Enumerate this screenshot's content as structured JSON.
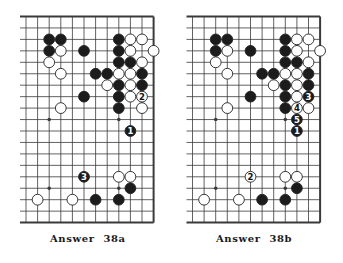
{
  "colors": {
    "background": "#ffffff",
    "line": "#3a3a3a",
    "black_stone": "#1c1c1c",
    "white_stone": "#ffffff",
    "stone_outline": "#222222"
  },
  "grid": {
    "cols": 12,
    "rows": 19,
    "open_left_edge": true,
    "spacing_x": 11.6,
    "spacing_y": 11.45
  },
  "diagrams": [
    {
      "id": "38a",
      "caption_word": "Answer",
      "caption_number": "38a",
      "origin": [
        26,
        16.5
      ],
      "star_points": [
        [
          2,
          9
        ],
        [
          8,
          9
        ],
        [
          2,
          15
        ],
        [
          8,
          15
        ]
      ],
      "stones": [
        {
          "c": 2,
          "r": 2,
          "color": "black"
        },
        {
          "c": 3,
          "r": 2,
          "color": "black"
        },
        {
          "c": 8,
          "r": 2,
          "color": "black"
        },
        {
          "c": 9,
          "r": 2,
          "color": "white"
        },
        {
          "c": 10,
          "r": 2,
          "color": "white"
        },
        {
          "c": 2,
          "r": 3,
          "color": "black"
        },
        {
          "c": 3,
          "r": 3,
          "color": "white"
        },
        {
          "c": 5,
          "r": 3,
          "color": "black"
        },
        {
          "c": 8,
          "r": 3,
          "color": "black"
        },
        {
          "c": 9,
          "r": 3,
          "color": "white"
        },
        {
          "c": 11,
          "r": 3,
          "color": "white"
        },
        {
          "c": 2,
          "r": 4,
          "color": "white"
        },
        {
          "c": 8,
          "r": 4,
          "color": "black"
        },
        {
          "c": 9,
          "r": 4,
          "color": "black"
        },
        {
          "c": 10,
          "r": 4,
          "color": "white"
        },
        {
          "c": 3,
          "r": 5,
          "color": "white"
        },
        {
          "c": 6,
          "r": 5,
          "color": "black"
        },
        {
          "c": 7,
          "r": 5,
          "color": "black"
        },
        {
          "c": 8,
          "r": 5,
          "color": "white"
        },
        {
          "c": 9,
          "r": 5,
          "color": "white"
        },
        {
          "c": 10,
          "r": 5,
          "color": "black"
        },
        {
          "c": 7,
          "r": 6,
          "color": "white"
        },
        {
          "c": 8,
          "r": 6,
          "color": "black"
        },
        {
          "c": 9,
          "r": 6,
          "color": "white"
        },
        {
          "c": 10,
          "r": 6,
          "color": "black"
        },
        {
          "c": 5,
          "r": 7,
          "color": "black"
        },
        {
          "c": 8,
          "r": 7,
          "color": "black"
        },
        {
          "c": 9,
          "r": 7,
          "color": "white"
        },
        {
          "c": 10,
          "r": 7,
          "color": "white",
          "label": "2"
        },
        {
          "c": 3,
          "r": 8,
          "color": "white"
        },
        {
          "c": 8,
          "r": 8,
          "color": "black"
        },
        {
          "c": 10,
          "r": 8,
          "color": "white"
        },
        {
          "c": 9,
          "r": 10,
          "color": "black",
          "label": "1"
        },
        {
          "c": 5,
          "r": 14,
          "color": "black",
          "label": "3"
        },
        {
          "c": 8,
          "r": 14,
          "color": "white"
        },
        {
          "c": 9,
          "r": 14,
          "color": "white"
        },
        {
          "c": 9,
          "r": 15,
          "color": "black"
        },
        {
          "c": 1,
          "r": 16,
          "color": "white"
        },
        {
          "c": 4,
          "r": 16,
          "color": "white"
        },
        {
          "c": 6,
          "r": 16,
          "color": "black"
        },
        {
          "c": 8,
          "r": 16,
          "color": "black"
        }
      ]
    },
    {
      "id": "38b",
      "caption_word": "Answer",
      "caption_number": "38b",
      "origin": [
        192.5,
        16.5
      ],
      "star_points": [
        [
          2,
          9
        ],
        [
          8,
          9
        ],
        [
          2,
          15
        ],
        [
          8,
          15
        ]
      ],
      "stones": [
        {
          "c": 2,
          "r": 2,
          "color": "black"
        },
        {
          "c": 3,
          "r": 2,
          "color": "black"
        },
        {
          "c": 8,
          "r": 2,
          "color": "black"
        },
        {
          "c": 9,
          "r": 2,
          "color": "white"
        },
        {
          "c": 10,
          "r": 2,
          "color": "white"
        },
        {
          "c": 2,
          "r": 3,
          "color": "black"
        },
        {
          "c": 3,
          "r": 3,
          "color": "white"
        },
        {
          "c": 5,
          "r": 3,
          "color": "black"
        },
        {
          "c": 8,
          "r": 3,
          "color": "black"
        },
        {
          "c": 9,
          "r": 3,
          "color": "white"
        },
        {
          "c": 11,
          "r": 3,
          "color": "white"
        },
        {
          "c": 2,
          "r": 4,
          "color": "white"
        },
        {
          "c": 8,
          "r": 4,
          "color": "black"
        },
        {
          "c": 9,
          "r": 4,
          "color": "black"
        },
        {
          "c": 10,
          "r": 4,
          "color": "white"
        },
        {
          "c": 3,
          "r": 5,
          "color": "white"
        },
        {
          "c": 6,
          "r": 5,
          "color": "black"
        },
        {
          "c": 7,
          "r": 5,
          "color": "black"
        },
        {
          "c": 8,
          "r": 5,
          "color": "white"
        },
        {
          "c": 9,
          "r": 5,
          "color": "white"
        },
        {
          "c": 10,
          "r": 5,
          "color": "black"
        },
        {
          "c": 7,
          "r": 6,
          "color": "white"
        },
        {
          "c": 8,
          "r": 6,
          "color": "black"
        },
        {
          "c": 9,
          "r": 6,
          "color": "white"
        },
        {
          "c": 10,
          "r": 6,
          "color": "black"
        },
        {
          "c": 5,
          "r": 7,
          "color": "black"
        },
        {
          "c": 8,
          "r": 7,
          "color": "black"
        },
        {
          "c": 9,
          "r": 7,
          "color": "white"
        },
        {
          "c": 10,
          "r": 7,
          "color": "black",
          "label": "3"
        },
        {
          "c": 3,
          "r": 8,
          "color": "white"
        },
        {
          "c": 8,
          "r": 8,
          "color": "black"
        },
        {
          "c": 9,
          "r": 8,
          "color": "white",
          "label": "4"
        },
        {
          "c": 10,
          "r": 8,
          "color": "white"
        },
        {
          "c": 9,
          "r": 9,
          "color": "black",
          "label": "5"
        },
        {
          "c": 9,
          "r": 10,
          "color": "black",
          "label": "1"
        },
        {
          "c": 5,
          "r": 14,
          "color": "white",
          "label": "2"
        },
        {
          "c": 8,
          "r": 14,
          "color": "white"
        },
        {
          "c": 9,
          "r": 14,
          "color": "white"
        },
        {
          "c": 9,
          "r": 15,
          "color": "black"
        },
        {
          "c": 1,
          "r": 16,
          "color": "white"
        },
        {
          "c": 4,
          "r": 16,
          "color": "white"
        },
        {
          "c": 6,
          "r": 16,
          "color": "black"
        },
        {
          "c": 8,
          "r": 16,
          "color": "black"
        }
      ]
    }
  ]
}
